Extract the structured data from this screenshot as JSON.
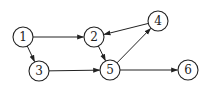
{
  "graph": {
    "type": "directed",
    "nodes": [
      {
        "id": "1",
        "label": "1",
        "x": 23,
        "y": 37
      },
      {
        "id": "2",
        "label": "2",
        "x": 94,
        "y": 37
      },
      {
        "id": "3",
        "label": "3",
        "x": 39,
        "y": 71
      },
      {
        "id": "4",
        "label": "4",
        "x": 158,
        "y": 21
      },
      {
        "id": "5",
        "label": "5",
        "x": 110,
        "y": 70
      },
      {
        "id": "6",
        "label": "6",
        "x": 188,
        "y": 70
      }
    ],
    "edges": [
      {
        "from": "1",
        "to": "2"
      },
      {
        "from": "1",
        "to": "3"
      },
      {
        "from": "3",
        "to": "5"
      },
      {
        "from": "2",
        "to": "5"
      },
      {
        "from": "5",
        "to": "4"
      },
      {
        "from": "4",
        "to": "2"
      },
      {
        "from": "5",
        "to": "6"
      }
    ],
    "node_radius": 10,
    "colors": {
      "stroke": "#222222",
      "fill": "#ffffff"
    }
  }
}
